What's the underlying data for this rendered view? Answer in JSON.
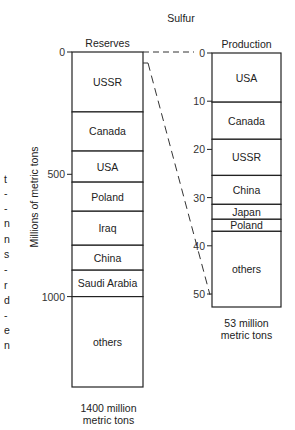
{
  "title": "Sulfur",
  "y_axis_label": "Millions of metric tons",
  "clipped_left_text": [
    "t",
    "-",
    "-",
    "n",
    "n",
    "s",
    "-",
    "r",
    "d",
    "-",
    "e",
    "n"
  ],
  "chart_data": {
    "type": "bar",
    "title": "Sulfur",
    "subtype": "stacked-column-comparison",
    "ylabel": "Millions of metric tons",
    "grid": false,
    "legend": "none (segments labeled inline)",
    "series": [
      {
        "name": "Reserves",
        "total_label": "1400 million metric tons",
        "total": 1400,
        "axis_ticks": [
          0,
          500,
          1000
        ],
        "ylim": [
          0,
          1400
        ],
        "segments": [
          {
            "label": "USSR",
            "value": 245
          },
          {
            "label": "Canada",
            "value": 160
          },
          {
            "label": "USA",
            "value": 127
          },
          {
            "label": "Poland",
            "value": 119
          },
          {
            "label": "Iraq",
            "value": 139
          },
          {
            "label": "China",
            "value": 102
          },
          {
            "label": "Saudi Arabia",
            "value": 108
          },
          {
            "label": "others",
            "value": 400
          }
        ]
      },
      {
        "name": "Production",
        "total_label": "53 million metric tons",
        "total": 53,
        "axis_ticks": [
          0,
          10,
          20,
          30,
          40,
          50
        ],
        "ylim": [
          0,
          53
        ],
        "segments": [
          {
            "label": "USA",
            "value": 10.2
          },
          {
            "label": "Canada",
            "value": 7.7
          },
          {
            "label": "USSR",
            "value": 7.5
          },
          {
            "label": "China",
            "value": 6.0
          },
          {
            "label": "Japan",
            "value": 3.1
          },
          {
            "label": "Poland",
            "value": 2.5
          },
          {
            "label": "others",
            "value": 16.0
          }
        ]
      }
    ],
    "annotations": [
      "Dashed lines connect the top of Reserves to 0 on the Production scale, and a 53-unit slice of the Reserves column to 50 on the Production scale (magnification)"
    ]
  },
  "reserves": {
    "header": "Reserves",
    "total_line1": "1400 million",
    "total_line2": "metric tons",
    "ticks": [
      "0",
      "500",
      "1000"
    ]
  },
  "production": {
    "header": "Production",
    "total_line1": "53 million",
    "total_line2": "metric tons",
    "ticks": [
      "0",
      "10",
      "20",
      "30",
      "40",
      "50"
    ]
  }
}
